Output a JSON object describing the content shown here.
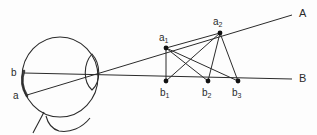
{
  "figure": {
    "kind": "optics-ray-diagram",
    "stroke_color": "#2b2b2b",
    "background_color": "#fdfdfd",
    "point_color": "#111111"
  },
  "labels": {
    "line_a_end": "A",
    "line_b_end": "B",
    "retina_upper": "b",
    "retina_lower": "a",
    "a1_base": "a",
    "a1_sub": "1",
    "a2_base": "a",
    "a2_sub": "2",
    "b1_base": "b",
    "b1_sub": "1",
    "b2_base": "b",
    "b2_sub": "2",
    "b3_base": "b",
    "b3_sub": "3"
  },
  "geometry": {
    "eye": {
      "globe_cx": 60,
      "globe_cy": 77,
      "globe_rx": 38,
      "globe_ry": 40,
      "lens_cx": 92,
      "lens_cy": 72,
      "lens_half_w": 9,
      "lens_half_h": 18
    },
    "points": {
      "a1": {
        "x": 166,
        "y": 48
      },
      "a2": {
        "x": 220,
        "y": 33
      },
      "b1": {
        "x": 166,
        "y": 81
      },
      "b2": {
        "x": 208,
        "y": 81
      },
      "b3": {
        "x": 238,
        "y": 81
      },
      "retina_b": {
        "x": 24,
        "y": 73
      },
      "retina_a": {
        "x": 27,
        "y": 95
      },
      "line_a_tip": {
        "x": 292,
        "y": 15
      },
      "line_b_tip": {
        "x": 292,
        "y": 79
      }
    },
    "point_radius": 2.4,
    "line_width": 1
  },
  "label_positions": {
    "A": {
      "x": 299,
      "y": 8
    },
    "B": {
      "x": 299,
      "y": 73
    },
    "b_retina": {
      "x": 11,
      "y": 68
    },
    "a_retina": {
      "x": 13,
      "y": 91
    },
    "a1": {
      "x": 159,
      "y": 33
    },
    "a2": {
      "x": 213,
      "y": 17
    },
    "b1": {
      "x": 160,
      "y": 88
    },
    "b2": {
      "x": 202,
      "y": 88
    },
    "b3": {
      "x": 232,
      "y": 88
    }
  },
  "connections": [
    {
      "from": "a1",
      "to": "b1"
    },
    {
      "from": "a1",
      "to": "b2"
    },
    {
      "from": "a1",
      "to": "b3"
    },
    {
      "from": "a1",
      "to": "a2"
    },
    {
      "from": "a2",
      "to": "b1"
    },
    {
      "from": "a2",
      "to": "b2"
    },
    {
      "from": "a2",
      "to": "b3"
    }
  ]
}
